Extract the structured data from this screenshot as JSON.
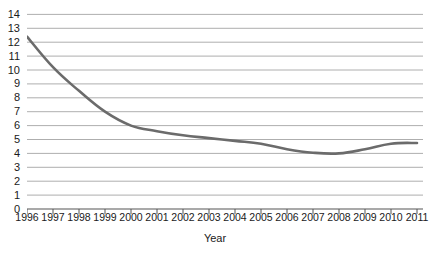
{
  "chart_data": {
    "type": "line",
    "title": "",
    "subtitle": "",
    "xlabel": "Year",
    "ylabel": "",
    "categories": [
      "1996",
      "1997",
      "1998",
      "1999",
      "2000",
      "2001",
      "2002",
      "2003",
      "2004",
      "2005",
      "2006",
      "2007",
      "2008",
      "2009",
      "2010",
      "2011"
    ],
    "x": [
      1996,
      1997,
      1998,
      1999,
      2000,
      2001,
      2002,
      2003,
      2004,
      2005,
      2006,
      2007,
      2008,
      2009,
      2010,
      2011
    ],
    "values": [
      12.4,
      10.2,
      8.5,
      7.0,
      6.0,
      5.6,
      5.3,
      5.1,
      4.9,
      4.7,
      4.3,
      4.05,
      4.0,
      4.3,
      4.7,
      4.75
    ],
    "series": [
      {
        "name": "",
        "values": [
          12.4,
          10.2,
          8.5,
          7.0,
          6.0,
          5.6,
          5.3,
          5.1,
          4.9,
          4.7,
          4.3,
          4.05,
          4.0,
          4.3,
          4.7,
          4.75
        ],
        "color": "#6b6b6b"
      }
    ],
    "ylim": [
      0,
      14
    ],
    "xlim": [
      1996,
      2011
    ],
    "yticks": [
      0,
      1,
      2,
      3,
      4,
      5,
      6,
      7,
      8,
      9,
      10,
      11,
      12,
      13,
      14
    ],
    "ytick_labels": [
      "0",
      "1",
      "2",
      "3",
      "4",
      "5",
      "6",
      "7",
      "8",
      "9",
      "10",
      "11",
      "12",
      "13",
      "14"
    ],
    "grid": true,
    "grid_axis": "y",
    "grid_color": "#999999",
    "legend": false,
    "legend_position": "none",
    "annotations": []
  },
  "style": {
    "line_color": "#6b6b6b",
    "axis_color": "#555555",
    "text_color": "#1a1a1a",
    "background": "#ffffff"
  }
}
